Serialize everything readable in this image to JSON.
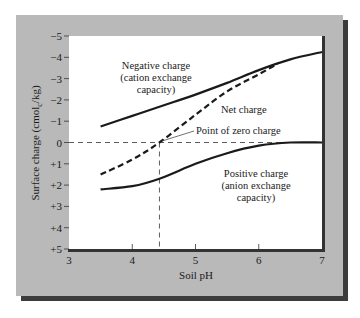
{
  "chart_data": {
    "type": "line",
    "title": "",
    "xlabel": "Soil pH",
    "ylabel": "Surface charge (cmolc/kg)",
    "ylabel_parts": {
      "main": "Surface charge (cmol",
      "sub": "c",
      "tail": "/kg)"
    },
    "xlim": [
      3,
      7
    ],
    "ylim": [
      -5,
      5
    ],
    "y_inverted": true,
    "x_ticks": [
      3,
      4,
      5,
      6,
      7
    ],
    "y_ticks": [
      -5,
      -4,
      -3,
      -2,
      -1,
      0,
      1,
      2,
      3,
      4,
      5
    ],
    "y_tick_labels": [
      "−5",
      "−4",
      "−3",
      "−2",
      "−1",
      "0",
      "+1",
      "+2",
      "+3",
      "+4",
      "+5"
    ],
    "grid": false,
    "series": [
      {
        "name": "Negative charge (cation exchange capacity)",
        "style": "solid",
        "x": [
          3.5,
          4.0,
          4.5,
          5.0,
          5.5,
          6.0,
          6.5,
          7.0
        ],
        "y": [
          -0.75,
          -1.25,
          -1.75,
          -2.25,
          -2.8,
          -3.4,
          -3.9,
          -4.25
        ]
      },
      {
        "name": "Net charge",
        "style": "dashed",
        "x": [
          3.5,
          4.0,
          4.43,
          5.0,
          5.5,
          6.0,
          6.3
        ],
        "y": [
          1.5,
          0.8,
          0.0,
          -1.3,
          -2.4,
          -3.2,
          -3.7
        ]
      },
      {
        "name": "Positive charge (anion exchange capacity)",
        "style": "solid",
        "x": [
          3.5,
          4.0,
          4.43,
          5.0,
          5.5,
          6.0,
          6.5,
          7.0
        ],
        "y": [
          2.2,
          2.05,
          1.7,
          1.0,
          0.5,
          0.15,
          0.0,
          0.0
        ]
      }
    ],
    "annotations": [
      {
        "text": "Negative charge",
        "line": 1
      },
      {
        "text": "(cation exchange",
        "line": 2
      },
      {
        "text": "capacity)",
        "line": 3
      },
      {
        "text": "Net charge"
      },
      {
        "text": "Point of zero charge",
        "x": 4.43,
        "y": 0
      },
      {
        "text": "Positive charge",
        "line": 1
      },
      {
        "text": "(anion exchange",
        "line": 2
      },
      {
        "text": "capacity)",
        "line": 3
      }
    ],
    "reference_lines": {
      "horizontal_y": 0,
      "vertical_x": 4.43
    }
  },
  "labels": {
    "neg1": "Negative charge",
    "neg2": "(cation exchange",
    "neg3": "capacity)",
    "net": "Net charge",
    "pzc": "Point of zero charge",
    "pos1": "Positive charge",
    "pos2": "(anion exchange",
    "pos3": "capacity)",
    "xlabel": "Soil pH",
    "ylabel_main": "Surface charge (cmol",
    "ylabel_sub": "c",
    "ylabel_tail": "/kg)",
    "x_ticks": [
      "3",
      "4",
      "5",
      "6",
      "7"
    ],
    "y_ticks": [
      "−5",
      "−4",
      "−3",
      "−2",
      "−1",
      "0",
      "+1",
      "+2",
      "+3",
      "+4",
      "+5"
    ]
  },
  "colors": {
    "panel": "#b9b9b9",
    "panel_shadow": "#3c3c3c",
    "plot_bg": "#ffffff",
    "line": "#1a1a1a"
  }
}
